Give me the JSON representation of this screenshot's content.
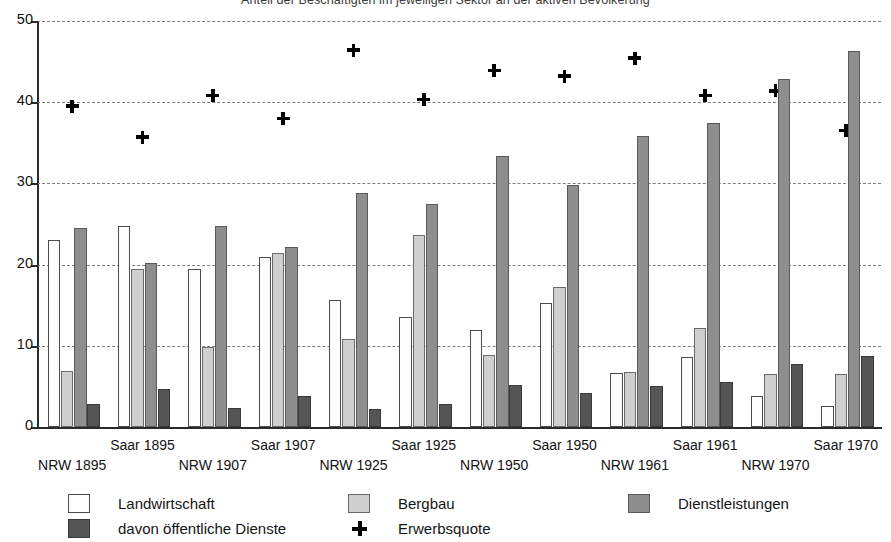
{
  "chart_data": {
    "type": "bar",
    "title": "Anteil der Beschäftigten im jeweiligen Sektor an der aktiven Bevölkerung",
    "xlabel": "",
    "ylabel": "",
    "ylim": [
      0,
      50
    ],
    "yticks": [
      0,
      10,
      20,
      30,
      40,
      50
    ],
    "grid": true,
    "legend_position": "bottom",
    "categories": [
      "NRW 1895",
      "Saar 1895",
      "NRW 1907",
      "Saar 1907",
      "NRW 1925",
      "Saar 1925",
      "NRW 1950",
      "Saar 1950",
      "NRW 1961",
      "Saar 1961",
      "NRW 1970",
      "Saar 1970"
    ],
    "category_rows": [
      {
        "label": "NRW 1895",
        "row": "bottom"
      },
      {
        "label": "Saar 1895",
        "row": "top"
      },
      {
        "label": "NRW 1907",
        "row": "bottom"
      },
      {
        "label": "Saar 1907",
        "row": "top"
      },
      {
        "label": "NRW 1925",
        "row": "bottom"
      },
      {
        "label": "Saar 1925",
        "row": "top"
      },
      {
        "label": "NRW 1950",
        "row": "bottom"
      },
      {
        "label": "Saar 1950",
        "row": "top"
      },
      {
        "label": "NRW 1961",
        "row": "bottom"
      },
      {
        "label": "Saar 1961",
        "row": "top"
      },
      {
        "label": "NRW 1970",
        "row": "bottom"
      },
      {
        "label": "Saar 1970",
        "row": "top"
      }
    ],
    "series": [
      {
        "name": "Landwirtschaft",
        "color": "#fdfdfd",
        "values": [
          23.0,
          24.8,
          19.5,
          20.9,
          15.6,
          13.6,
          12.0,
          15.3,
          6.6,
          8.6,
          3.8,
          2.6
        ]
      },
      {
        "name": "Bergbau",
        "color": "#cfcfcf",
        "values": [
          6.9,
          19.4,
          9.9,
          21.4,
          10.8,
          23.7,
          8.9,
          17.3,
          6.8,
          12.2,
          6.5,
          6.5
        ]
      },
      {
        "name": "Dienstleistungen",
        "color": "#8e8e8e",
        "values": [
          24.5,
          20.2,
          24.8,
          22.2,
          28.8,
          27.5,
          33.4,
          29.8,
          35.9,
          37.5,
          42.8,
          46.3
        ]
      },
      {
        "name": "davon öffentliche Dienste",
        "color": "#555555",
        "values": [
          2.8,
          4.7,
          2.4,
          3.8,
          2.2,
          2.8,
          5.2,
          4.2,
          5.1,
          5.5,
          7.7,
          8.8
        ]
      }
    ],
    "marker_series": {
      "name": "Erwerbsquote",
      "marker": "plus",
      "color": "#000000",
      "values": [
        39.5,
        35.7,
        40.8,
        38.0,
        46.4,
        40.3,
        43.9,
        43.2,
        45.4,
        40.8,
        41.4,
        36.5
      ]
    }
  },
  "legend": {
    "items": [
      {
        "label": "Landwirtschaft",
        "swatch": "landwirtschaft"
      },
      {
        "label": "Bergbau",
        "swatch": "bergbau"
      },
      {
        "label": "Dienstleistungen",
        "swatch": "dienstleistungen"
      },
      {
        "label": "davon öffentliche Dienste",
        "swatch": "oeffentliche"
      },
      {
        "label": "Erwerbsquote",
        "swatch": "plus-marker"
      }
    ]
  }
}
